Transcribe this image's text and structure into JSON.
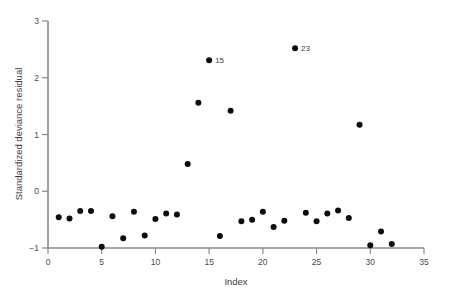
{
  "chart_data": {
    "type": "scatter",
    "title": "",
    "xlabel": "Index",
    "ylabel": "Standardized deviance residual",
    "xlim": [
      0,
      35
    ],
    "ylim": [
      -1,
      3
    ],
    "grid": false,
    "legend": null,
    "xticks": [
      0,
      5,
      10,
      15,
      20,
      25,
      30,
      35
    ],
    "xtick_labels": [
      "0",
      "5",
      "10",
      "15",
      "20",
      "25",
      "30",
      "35"
    ],
    "yticks": [
      -1,
      0,
      1,
      2,
      3
    ],
    "ytick_labels": [
      "−1",
      "0",
      "1",
      "2",
      "3"
    ],
    "marker": "filled-circle",
    "marker_color": "#0d0d0d",
    "marker_size": 3.0,
    "x": [
      1,
      2,
      3,
      4,
      5,
      6,
      7,
      8,
      9,
      10,
      11,
      12,
      13,
      14,
      15,
      16,
      17,
      18,
      19,
      20,
      21,
      22,
      23,
      24,
      25,
      26,
      27,
      28,
      29,
      30,
      31,
      32
    ],
    "y": [
      -0.46,
      -0.48,
      -0.35,
      -0.35,
      -0.98,
      -0.44,
      -0.83,
      -0.36,
      -0.78,
      -0.49,
      -0.39,
      -0.41,
      0.48,
      1.56,
      2.31,
      -0.79,
      1.42,
      -0.53,
      -0.5,
      -0.36,
      -0.63,
      -0.52,
      2.52,
      -0.38,
      -0.53,
      -0.39,
      -0.34,
      -0.47,
      1.17,
      -0.95,
      -0.71,
      -0.93
    ],
    "annotations": [
      {
        "index": 15,
        "label": "15",
        "x": 15,
        "y": 2.31
      },
      {
        "index": 23,
        "label": "23",
        "x": 23,
        "y": 2.52
      }
    ]
  },
  "axes": {
    "y_title": "Standardized deviance residual",
    "x_title": "Index"
  },
  "colors": {
    "marker": "#0d0d0d",
    "axis": "#8a8a8a",
    "text": "#3d3d3d",
    "background": "#ffffff"
  }
}
